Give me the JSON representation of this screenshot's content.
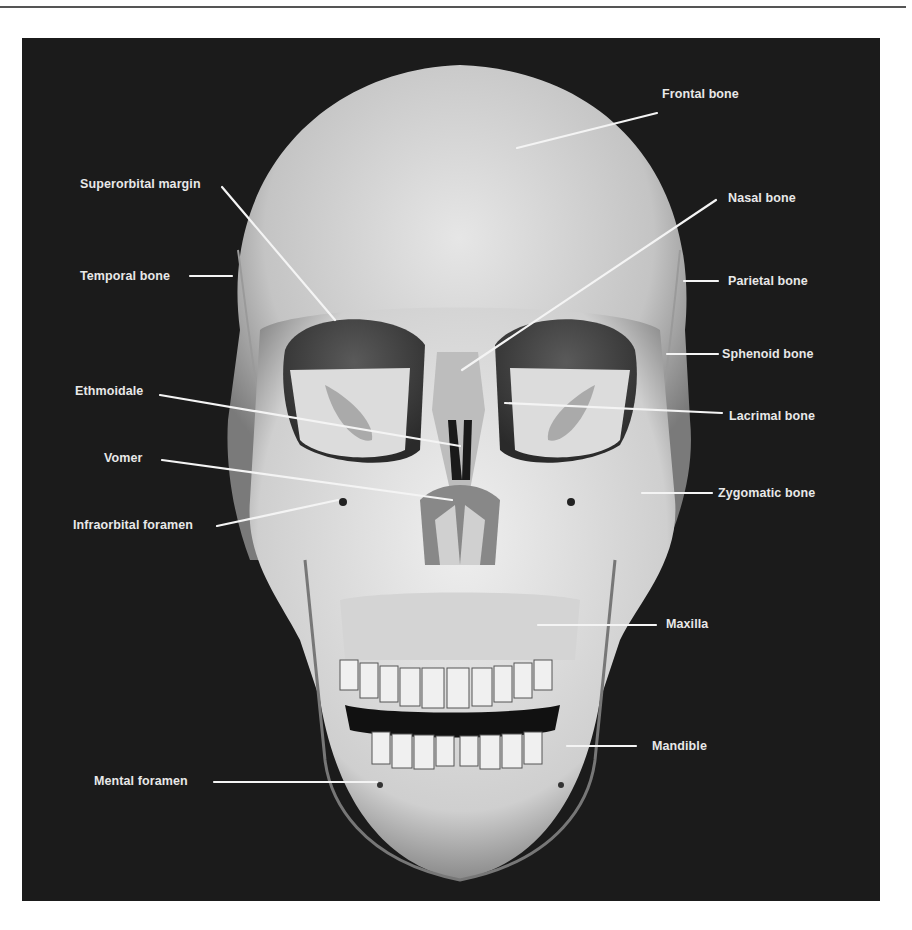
{
  "figure": {
    "title": "",
    "colors": {
      "background": "#1b1b1b",
      "label_text": "#e8e8e8",
      "leader_line": "#f4f4f4",
      "bone": "#d8d8d8"
    },
    "labels": {
      "frontal_bone": "Frontal bone",
      "superorbital_margin": "Superorbital margin",
      "nasal_bone": "Nasal bone",
      "temporal_bone": "Temporal bone",
      "parietal_bone": "Parietal bone",
      "sphenoid_bone": "Sphenoid bone",
      "ethmoidale": "Ethmoidale",
      "lacrimal_bone": "Lacrimal bone",
      "vomer": "Vomer",
      "zygomatic_bone": "Zygomatic bone",
      "infraorbital_foramen": "Infraorbital foramen",
      "maxilla": "Maxilla",
      "mandible": "Mandible",
      "mental_foramen": "Mental foramen"
    }
  }
}
